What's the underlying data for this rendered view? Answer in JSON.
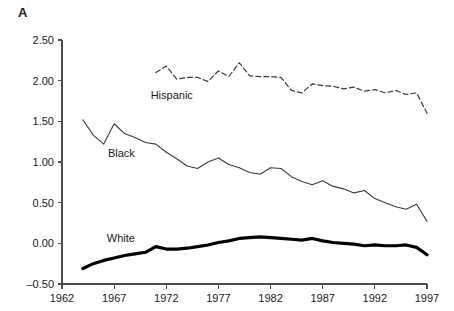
{
  "figure": {
    "panel_label": "A",
    "background_color": "#ffffff",
    "axis_color": "#4d4d4d",
    "text_color": "#1a1a1a"
  },
  "chart_data": {
    "type": "line",
    "title": "",
    "subtitle": "",
    "xlabel": "",
    "ylabel": "",
    "xlim": [
      1962,
      1997
    ],
    "ylim": [
      -0.5,
      2.5
    ],
    "xticks": [
      1962,
      1967,
      1972,
      1977,
      1982,
      1987,
      1992,
      1997
    ],
    "xtick_labels": [
      "1962",
      "1967",
      "1972",
      "1977",
      "1982",
      "1987",
      "1992",
      "1997"
    ],
    "yticks": [
      -0.5,
      0.0,
      0.5,
      1.0,
      1.5,
      2.0,
      2.5
    ],
    "ytick_labels": [
      "–0.50",
      "0.00",
      "0.50",
      "1.00",
      "1.50",
      "2.00",
      "2.50"
    ],
    "grid": false,
    "legend_position": "inline-annotations",
    "series": [
      {
        "name": "Hispanic",
        "label": "Hispanic",
        "style": "dashed",
        "color": "#3a3a3a",
        "width": 1.2,
        "label_x": 1970.5,
        "label_y": 1.78,
        "x": [
          1971,
          1972,
          1973,
          1974,
          1975,
          1976,
          1977,
          1978,
          1979,
          1980,
          1981,
          1982,
          1983,
          1984,
          1985,
          1986,
          1987,
          1988,
          1989,
          1990,
          1991,
          1992,
          1993,
          1994,
          1995,
          1996,
          1997
        ],
        "values": [
          2.1,
          2.18,
          2.02,
          2.04,
          2.04,
          1.99,
          2.12,
          2.05,
          2.22,
          2.06,
          2.05,
          2.05,
          2.04,
          1.88,
          1.85,
          1.96,
          1.94,
          1.93,
          1.9,
          1.92,
          1.87,
          1.89,
          1.85,
          1.88,
          1.83,
          1.85,
          1.6
        ]
      },
      {
        "name": "Black",
        "label": "Black",
        "style": "solid",
        "color": "#3a3a3a",
        "width": 1.1,
        "label_x": 1966.4,
        "label_y": 1.06,
        "x": [
          1964,
          1965,
          1966,
          1967,
          1968,
          1969,
          1970,
          1971,
          1972,
          1973,
          1974,
          1975,
          1976,
          1977,
          1978,
          1979,
          1980,
          1981,
          1982,
          1983,
          1984,
          1985,
          1986,
          1987,
          1988,
          1989,
          1990,
          1991,
          1992,
          1993,
          1994,
          1995,
          1996,
          1997
        ],
        "values": [
          1.52,
          1.33,
          1.22,
          1.47,
          1.35,
          1.3,
          1.24,
          1.22,
          1.12,
          1.04,
          0.95,
          0.92,
          1.0,
          1.05,
          0.97,
          0.93,
          0.87,
          0.85,
          0.93,
          0.92,
          0.82,
          0.76,
          0.72,
          0.77,
          0.7,
          0.67,
          0.62,
          0.65,
          0.55,
          0.5,
          0.45,
          0.42,
          0.48,
          0.27
        ]
      },
      {
        "name": "White",
        "label": "White",
        "style": "solid-bold",
        "color": "#000000",
        "width": 3.2,
        "label_x": 1966.3,
        "label_y": 0.02,
        "x": [
          1964,
          1965,
          1966,
          1967,
          1968,
          1969,
          1970,
          1971,
          1972,
          1973,
          1974,
          1975,
          1976,
          1977,
          1978,
          1979,
          1980,
          1981,
          1982,
          1983,
          1984,
          1985,
          1986,
          1987,
          1988,
          1989,
          1990,
          1991,
          1992,
          1993,
          1994,
          1995,
          1996,
          1997
        ],
        "values": [
          -0.31,
          -0.25,
          -0.21,
          -0.18,
          -0.15,
          -0.13,
          -0.11,
          -0.04,
          -0.07,
          -0.07,
          -0.06,
          -0.04,
          -0.02,
          0.01,
          0.03,
          0.06,
          0.07,
          0.08,
          0.07,
          0.06,
          0.05,
          0.04,
          0.06,
          0.03,
          0.01,
          0.0,
          -0.01,
          -0.03,
          -0.02,
          -0.03,
          -0.03,
          -0.02,
          -0.05,
          -0.14
        ]
      }
    ]
  }
}
